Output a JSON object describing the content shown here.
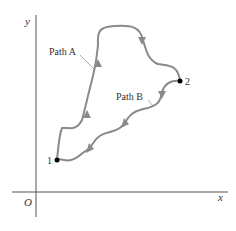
{
  "diagram": {
    "axes": {
      "x_label": "x",
      "y_label": "y",
      "origin_label": "O",
      "color": "#555555"
    },
    "points": [
      {
        "label": "1",
        "color": "#000000"
      },
      {
        "label": "2",
        "color": "#000000"
      }
    ],
    "paths": [
      {
        "label": "Path A",
        "color": "#8a8a8a",
        "direction": "from 1 to 2"
      },
      {
        "label": "Path B",
        "color": "#8a8a8a",
        "direction": "from 2 to 1"
      }
    ]
  }
}
